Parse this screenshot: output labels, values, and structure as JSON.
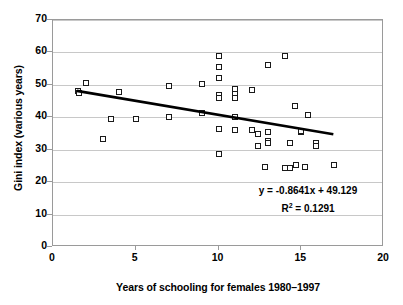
{
  "chart_data": {
    "type": "scatter",
    "title": "",
    "xlabel": "Years of schooling for females 1980–1997",
    "ylabel": "Gini index (various years)",
    "xlim": [
      0,
      20
    ],
    "ylim": [
      0,
      70
    ],
    "xticks": [
      0,
      5,
      10,
      15,
      20
    ],
    "yticks": [
      0,
      10,
      20,
      30,
      40,
      50,
      60,
      70
    ],
    "xtick_labels": [
      "0",
      "5",
      "10",
      "15",
      "20"
    ],
    "ytick_labels": [
      "0",
      "10",
      "20",
      "30",
      "40",
      "50",
      "60",
      "70"
    ],
    "grid": "horizontal",
    "legend": "none",
    "marker": "open-square",
    "points": [
      {
        "x": 1.5,
        "y": 48.0
      },
      {
        "x": 1.6,
        "y": 47.6
      },
      {
        "x": 2.0,
        "y": 50.5
      },
      {
        "x": 3.0,
        "y": 33.4
      },
      {
        "x": 3.5,
        "y": 39.6
      },
      {
        "x": 4.0,
        "y": 47.8
      },
      {
        "x": 5.0,
        "y": 39.5
      },
      {
        "x": 7.0,
        "y": 49.7
      },
      {
        "x": 7.0,
        "y": 40.0
      },
      {
        "x": 9.0,
        "y": 50.2
      },
      {
        "x": 9.0,
        "y": 41.2
      },
      {
        "x": 10.0,
        "y": 59.0
      },
      {
        "x": 10.0,
        "y": 55.6
      },
      {
        "x": 10.0,
        "y": 52.1
      },
      {
        "x": 10.0,
        "y": 47.0
      },
      {
        "x": 10.0,
        "y": 46.0
      },
      {
        "x": 10.0,
        "y": 36.3
      },
      {
        "x": 10.0,
        "y": 28.7
      },
      {
        "x": 11.0,
        "y": 48.6
      },
      {
        "x": 11.0,
        "y": 47.3
      },
      {
        "x": 11.0,
        "y": 45.9
      },
      {
        "x": 11.0,
        "y": 40.1
      },
      {
        "x": 11.0,
        "y": 36.1
      },
      {
        "x": 12.0,
        "y": 48.4
      },
      {
        "x": 12.0,
        "y": 36.0
      },
      {
        "x": 12.4,
        "y": 35.0
      },
      {
        "x": 12.4,
        "y": 31.2
      },
      {
        "x": 13.0,
        "y": 56.2
      },
      {
        "x": 13.0,
        "y": 35.6
      },
      {
        "x": 13.0,
        "y": 32.6
      },
      {
        "x": 13.0,
        "y": 32.0
      },
      {
        "x": 12.8,
        "y": 24.7
      },
      {
        "x": 14.0,
        "y": 59.0
      },
      {
        "x": 14.0,
        "y": 24.4
      },
      {
        "x": 14.3,
        "y": 24.5
      },
      {
        "x": 14.3,
        "y": 32.2
      },
      {
        "x": 14.7,
        "y": 25.3
      },
      {
        "x": 14.6,
        "y": 43.4
      },
      {
        "x": 15.0,
        "y": 35.5
      },
      {
        "x": 15.0,
        "y": 35.9
      },
      {
        "x": 15.2,
        "y": 24.8
      },
      {
        "x": 15.4,
        "y": 40.6
      },
      {
        "x": 15.9,
        "y": 32.0
      },
      {
        "x": 15.9,
        "y": 31.1
      },
      {
        "x": 17.0,
        "y": 25.2
      }
    ],
    "trendline": {
      "slope": -0.8641,
      "intercept": 49.129,
      "x_start": 1.5,
      "x_end": 17.0,
      "equation": "y = -0.8641x + 49.129",
      "r2_prefix": "R",
      "r2_exponent": "2",
      "r2_value": " = 0.1291"
    },
    "colors": {
      "marker_edge": "#1a1a1a",
      "marker_fill": "#ffffff",
      "trendline": "#000000",
      "gridline": "#c8c8c8",
      "axis": "#9a9a9a",
      "text": "#000000",
      "background": "#ffffff"
    }
  }
}
